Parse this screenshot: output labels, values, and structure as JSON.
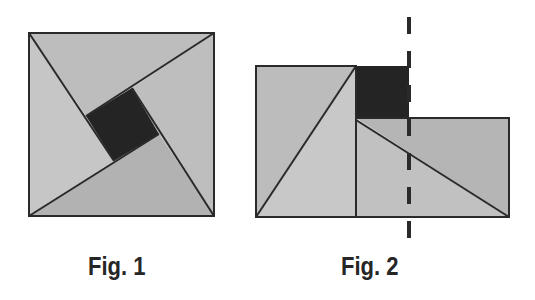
{
  "figures": [
    {
      "caption": "Fig. 1",
      "description": "Square divided into four congruent right triangles around a small dark central square (pinwheel arrangement)",
      "outer_square": {
        "x1": 29,
        "y1": 33,
        "x2": 214,
        "y2": 216
      },
      "inner_square": [
        [
          132,
          88
        ],
        [
          159,
          134
        ],
        [
          114,
          161
        ],
        [
          86,
          116
        ]
      ],
      "colors": {
        "top_triangle": "#bdbdbd",
        "left_triangle": "#c6c6c6",
        "bottom_triangle": "#b2b2b2",
        "right_triangle": "#bebebe",
        "center_square": "#242424",
        "stroke": "#2a2a2a"
      }
    },
    {
      "caption": "Fig. 2",
      "description": "The same pieces rearranged into two rectangles plus the dark square, with a dashed vertical line",
      "left_rect": {
        "x1": 256,
        "y1": 66,
        "x2": 356,
        "y2": 217
      },
      "dark_rect": {
        "x1": 356,
        "y1": 66,
        "x2": 409,
        "y2": 118
      },
      "right_rect": {
        "x1": 356,
        "y1": 118,
        "x2": 509,
        "y2": 217
      },
      "dashed_line_x": 409,
      "colors": {
        "left_upper_triangle": "#bcbcbc",
        "left_lower_triangle": "#c8c8c8",
        "right_upper_triangle": "#b5b5b5",
        "right_lower_triangle": "#c1c1c1",
        "dark_square": "#242424",
        "stroke": "#2a2a2a",
        "dash": "#2a2a2a"
      }
    }
  ]
}
